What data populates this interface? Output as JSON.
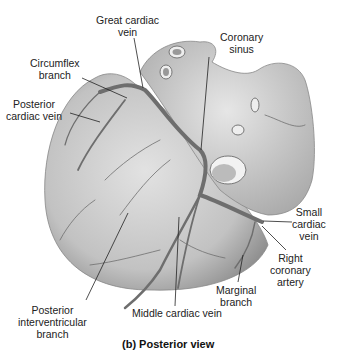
{
  "labels": {
    "great_cardiac_vein": [
      "Great cardiac",
      "vein"
    ],
    "coronary_sinus": [
      "Coronary",
      "sinus"
    ],
    "circumflex_branch": [
      "Circumflex",
      "branch"
    ],
    "posterior_cardiac_vein": [
      "Posterior",
      "cardiac vein"
    ],
    "small_cardiac_vein": [
      "Small",
      "cardiac",
      "vein"
    ],
    "right_coronary_artery": [
      "Right",
      "coronary",
      "artery"
    ],
    "marginal_branch": [
      "Marginal",
      "branch"
    ],
    "posterior_interventricular_branch": [
      "Posterior",
      "interventricular",
      "branch"
    ],
    "middle_cardiac_vein": [
      "Middle cardiac vein"
    ]
  },
  "caption": "(b) Posterior view",
  "colors": {
    "heart_fill": "#c9c9c9",
    "heart_shade": "#9a9a9a",
    "vessel": "#6e6e6e",
    "leader_line": "#222222"
  }
}
